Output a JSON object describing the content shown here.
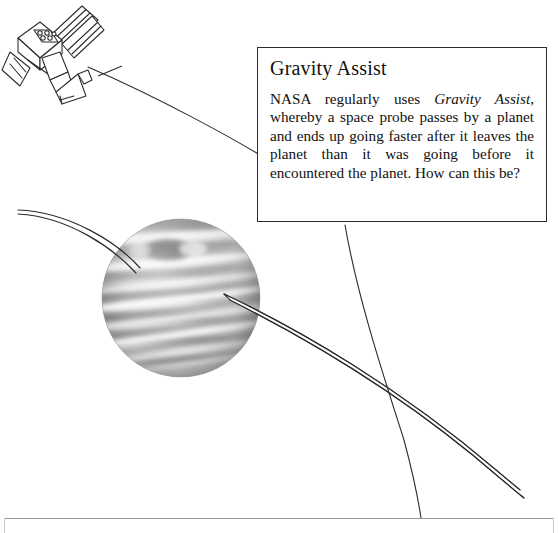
{
  "figure": {
    "background_color": "#ffffff",
    "line_color": "#2b2b2b"
  },
  "callout": {
    "heading": "Gravity Assist",
    "body_segments": [
      {
        "text": "NASA regularly uses ",
        "style": "normal"
      },
      {
        "text": "Gravity Assist",
        "style": "italic"
      },
      {
        "text": ", whereby a space probe passes by a planet and ends up going faster after it leaves the planet than it was going before it encountered the planet. How can this be?",
        "style": "normal"
      }
    ],
    "body_plain": "NASA regularly uses Gravity Assist, whereby a space probe passes by a planet and ends up going faster after it leaves the planet than it was going before it encountered the planet. How can this be?",
    "border_color": "#2b2b2b",
    "background_color": "#ffffff"
  },
  "objects": {
    "spacecraft": {
      "name": "space probe",
      "position": {
        "x": 45,
        "y": 52
      },
      "description": "line-art spacecraft with solar panel array and dish antenna"
    },
    "planet": {
      "name": "banded gas giant planet",
      "center": {
        "x": 181,
        "y": 298
      },
      "radius": 79,
      "features": [
        "horizontal cloud bands",
        "dark oval storm spot",
        "grayscale shading"
      ]
    }
  },
  "trajectories": [
    {
      "id": "probe-departure-line",
      "label": "probe path from spacecraft toward planet",
      "style": "single-line"
    },
    {
      "id": "incoming-flyby-band",
      "label": "incoming trajectory entering planet from the left",
      "style": "double-line-band"
    },
    {
      "id": "outgoing-flyby-band",
      "label": "outgoing trajectory leaving planet to lower right, faster",
      "style": "double-line-band"
    },
    {
      "id": "reference-arc",
      "label": "curved reference arc sweeping down the right side",
      "style": "single-line"
    }
  ],
  "footer": {
    "page_number": "",
    "caption": ""
  }
}
